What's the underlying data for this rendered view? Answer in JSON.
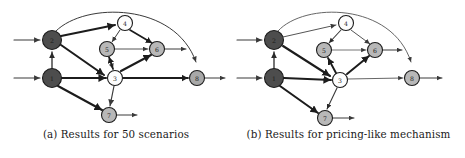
{
  "figure": {
    "type": "directed-network-graph-pair"
  },
  "subfigures": [
    {
      "id": "a",
      "caption": "(a) Results for 50 scenarios",
      "nodes": [
        {
          "id": "2",
          "label": "2",
          "cx": 52,
          "cy": 40,
          "r": 9.5,
          "fill": "#4d4d4d",
          "stroke": "#1c1c1c",
          "label_class": "on-dark"
        },
        {
          "id": "1",
          "label": "1",
          "cx": 52,
          "cy": 78,
          "r": 9.5,
          "fill": "#4d4d4d",
          "stroke": "#1c1c1c",
          "label_class": "on-dark"
        },
        {
          "id": "4",
          "label": "4",
          "cx": 125,
          "cy": 23,
          "r": 7.5,
          "fill": "#fdfdfd",
          "stroke": "#1c1c1c",
          "label_class": "on-light"
        },
        {
          "id": "5",
          "label": "5",
          "cx": 107,
          "cy": 49,
          "r": 7.5,
          "fill": "#b8b8b8",
          "stroke": "#1c1c1c",
          "label_class": "on-light"
        },
        {
          "id": "6",
          "label": "6",
          "cx": 157,
          "cy": 49,
          "r": 7.5,
          "fill": "#b8b8b8",
          "stroke": "#1c1c1c",
          "label_class": "on-light"
        },
        {
          "id": "3",
          "label": "3",
          "cx": 115,
          "cy": 78,
          "r": 7.5,
          "fill": "#fdfdfd",
          "stroke": "#1c1c1c",
          "label_class": "on-light"
        },
        {
          "id": "8",
          "label": "8",
          "cx": 197,
          "cy": 78,
          "r": 7.5,
          "fill": "#a8a8a8",
          "stroke": "#1c1c1c",
          "label_class": "on-light"
        },
        {
          "id": "7",
          "label": "7",
          "cx": 109,
          "cy": 115,
          "r": 7.5,
          "fill": "#b8b8b8",
          "stroke": "#1c1c1c",
          "label_class": "on-light"
        }
      ],
      "edges": [
        {
          "name": "source-to-2",
          "d": "M 14,40 L 40,40",
          "w": 1.1,
          "color": "#3a3a3a",
          "arrow": "a-head-thin"
        },
        {
          "name": "source-to-1",
          "d": "M 14,78 L 40,78",
          "w": 1.1,
          "color": "#3a3a3a",
          "arrow": "a-head-thin"
        },
        {
          "name": "1-to-2",
          "d": "M 52,68 L 52,52",
          "w": 1.3,
          "color": "#2a2a2a",
          "arrow": "a-head-med"
        },
        {
          "name": "2-to-4",
          "d": "M 61,36 L 115,25",
          "w": 2.1,
          "color": "#1c1c1c",
          "arrow": "a-head-thick"
        },
        {
          "name": "2-to-3",
          "d": "M 61,45 L 104,75",
          "w": 2.1,
          "color": "#1c1c1c",
          "arrow": "a-head-thick"
        },
        {
          "name": "2-to-8-arc",
          "d": "M 56,31 C 85,2 175,2 196,62",
          "w": 1.0,
          "color": "#3a3a3a",
          "arrow": "a-head-thin"
        },
        {
          "name": "4-to-5",
          "d": "M 120,30 L 112,42",
          "w": 1.0,
          "color": "#3a3a3a",
          "arrow": "a-head-thin"
        },
        {
          "name": "4-to-6",
          "d": "M 130,30 L 152,43",
          "w": 1.7,
          "color": "#1c1c1c",
          "arrow": "a-head-thick"
        },
        {
          "name": "5-to-6",
          "d": "M 115,49 L 148,49",
          "w": 1.0,
          "color": "#555555",
          "arrow": "a-head-thin"
        },
        {
          "name": "5-to-3",
          "d": "M 109,57 L 113,69",
          "w": 1.0,
          "color": "#3a3a3a",
          "arrow": "a-head-thin"
        },
        {
          "name": "3-to-5",
          "d": "M 113,69 L 109,57",
          "w": 1.7,
          "color": "#1c1c1c",
          "arrow": "a-head-thick"
        },
        {
          "name": "3-to-6",
          "d": "M 121,71 L 151,55",
          "w": 2.1,
          "color": "#1c1c1c",
          "arrow": "a-head-thick"
        },
        {
          "name": "1-to-3",
          "d": "M 62,78 L 106,78",
          "w": 2.1,
          "color": "#1c1c1c",
          "arrow": "a-head-thick"
        },
        {
          "name": "3-to-8",
          "d": "M 123,78 L 188,78",
          "w": 1.8,
          "color": "#1c1c1c",
          "arrow": "a-head-thick"
        },
        {
          "name": "6-to-out",
          "d": "M 165,49 L 186,49",
          "w": 1.0,
          "color": "#3a3a3a",
          "arrow": "a-head-thin"
        },
        {
          "name": "8-to-out",
          "d": "M 205,78 L 225,78",
          "w": 1.0,
          "color": "#3a3a3a",
          "arrow": "a-head-thin"
        },
        {
          "name": "1-to-7",
          "d": "M 58,86 L 102,110",
          "w": 2.1,
          "color": "#1c1c1c",
          "arrow": "a-head-thick"
        },
        {
          "name": "3-to-7",
          "d": "M 114,86 L 110,106",
          "w": 1.2,
          "color": "#3a3a3a",
          "arrow": "a-head-thin"
        },
        {
          "name": "7-to-out",
          "d": "M 117,115 L 137,115",
          "w": 1.0,
          "color": "#3a3a3a",
          "arrow": "a-head-thin"
        }
      ]
    },
    {
      "id": "b",
      "caption": "(b) Results for pricing-like mechanism",
      "nodes": [
        {
          "id": "2",
          "label": "2",
          "cx": 42,
          "cy": 40,
          "r": 9.5,
          "fill": "#4d4d4d",
          "stroke": "#1c1c1c",
          "label_class": "on-dark"
        },
        {
          "id": "1",
          "label": "1",
          "cx": 42,
          "cy": 78,
          "r": 9.5,
          "fill": "#4d4d4d",
          "stroke": "#1c1c1c",
          "label_class": "on-dark"
        },
        {
          "id": "4",
          "label": "4",
          "cx": 114,
          "cy": 23,
          "r": 7.5,
          "fill": "#fdfdfd",
          "stroke": "#1c1c1c",
          "label_class": "on-light"
        },
        {
          "id": "5",
          "label": "5",
          "cx": 92,
          "cy": 50,
          "r": 7.5,
          "fill": "#b8b8b8",
          "stroke": "#1c1c1c",
          "label_class": "on-light"
        },
        {
          "id": "6",
          "label": "6",
          "cx": 143,
          "cy": 50,
          "r": 7.5,
          "fill": "#b8b8b8",
          "stroke": "#1c1c1c",
          "label_class": "on-light"
        },
        {
          "id": "3",
          "label": "3",
          "cx": 108,
          "cy": 80,
          "r": 7.5,
          "fill": "#fdfdfd",
          "stroke": "#1c1c1c",
          "label_class": "on-light"
        },
        {
          "id": "8",
          "label": "8",
          "cx": 180,
          "cy": 78,
          "r": 7.5,
          "fill": "#b8b8b8",
          "stroke": "#1c1c1c",
          "label_class": "on-light"
        },
        {
          "id": "7",
          "label": "7",
          "cx": 93,
          "cy": 118,
          "r": 7.5,
          "fill": "#b8b8b8",
          "stroke": "#1c1c1c",
          "label_class": "on-light"
        }
      ],
      "edges": [
        {
          "name": "source-to-2",
          "d": "M 5,40 L 30,40",
          "w": 1.1,
          "color": "#3a3a3a",
          "arrow": "b-head-thin"
        },
        {
          "name": "source-to-1",
          "d": "M 5,78 L 30,78",
          "w": 1.1,
          "color": "#3a3a3a",
          "arrow": "b-head-thin"
        },
        {
          "name": "1-to-2",
          "d": "M 42,68 L 42,52",
          "w": 1.3,
          "color": "#2a2a2a",
          "arrow": "b-head-med"
        },
        {
          "name": "2-to-4",
          "d": "M 51,37 L 104,25",
          "w": 1.0,
          "color": "#555555",
          "arrow": "b-head-thin"
        },
        {
          "name": "2-to-3",
          "d": "M 51,46 L 98,76",
          "w": 2.1,
          "color": "#1c1c1c",
          "arrow": "b-head-thick"
        },
        {
          "name": "2-to-8-arc",
          "d": "M 46,31 C 72,2 160,2 179,62",
          "w": 0.9,
          "color": "#555555",
          "arrow": "b-head-thin"
        },
        {
          "name": "4-to-5",
          "d": "M 109,30 L 97,43",
          "w": 1.1,
          "color": "#3a3a3a",
          "arrow": "b-head-med"
        },
        {
          "name": "4-to-6",
          "d": "M 119,30 L 138,44",
          "w": 1.0,
          "color": "#555555",
          "arrow": "b-head-thin"
        },
        {
          "name": "5-to-6",
          "d": "M 100,50 L 134,50",
          "w": 0.9,
          "color": "#666666",
          "arrow": "b-head-thin"
        },
        {
          "name": "3-to-5",
          "d": "M 104,73 L 96,58",
          "w": 1.9,
          "color": "#1c1c1c",
          "arrow": "b-head-thick"
        },
        {
          "name": "3-to-6",
          "d": "M 115,74 L 137,56",
          "w": 2.0,
          "color": "#1c1c1c",
          "arrow": "b-head-thick"
        },
        {
          "name": "1-to-3",
          "d": "M 52,78 L 99,80",
          "w": 2.1,
          "color": "#1c1c1c",
          "arrow": "b-head-thick"
        },
        {
          "name": "3-to-8",
          "d": "M 116,79 L 171,78",
          "w": 0.9,
          "color": "#555555",
          "arrow": "b-head-thin"
        },
        {
          "name": "6-to-out",
          "d": "M 151,50 L 170,50",
          "w": 1.0,
          "color": "#3a3a3a",
          "arrow": "b-head-thin"
        },
        {
          "name": "8-to-out",
          "d": "M 188,78 L 210,78",
          "w": 1.0,
          "color": "#3a3a3a",
          "arrow": "b-head-thin"
        },
        {
          "name": "1-to-7",
          "d": "M 48,86 L 86,113",
          "w": 2.1,
          "color": "#1c1c1c",
          "arrow": "b-head-thick"
        },
        {
          "name": "3-to-7",
          "d": "M 105,88 L 95,109",
          "w": 1.1,
          "color": "#3a3a3a",
          "arrow": "b-head-med"
        },
        {
          "name": "7-to-out",
          "d": "M 101,118 L 122,118",
          "w": 1.0,
          "color": "#3a3a3a",
          "arrow": "b-head-thin"
        }
      ]
    }
  ],
  "colors": {
    "node_dark": "#4d4d4d",
    "node_gray": "#b8b8b8",
    "node_white": "#fdfdfd",
    "edge_dark": "#1c1c1c",
    "edge_light": "#555555",
    "background": "#ffffff"
  }
}
